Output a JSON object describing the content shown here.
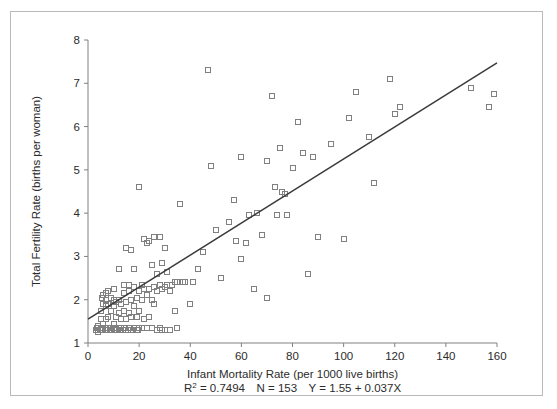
{
  "figure": {
    "frame_color": "#b9b9b9",
    "background": "#ffffff",
    "axis_color": "#808080",
    "marker_color": "#808080",
    "line_color": "#3a3a3a"
  },
  "chart_data": {
    "type": "scatter",
    "title": "",
    "xlabel": "Infant Mortality Rate (per 1000 live births)",
    "ylabel": "Total Fertility Rate (births per woman)",
    "xlim": [
      0,
      160
    ],
    "ylim": [
      1,
      8
    ],
    "xticks": [
      0,
      20,
      40,
      60,
      80,
      100,
      120,
      140,
      160
    ],
    "yticks": [
      1,
      2,
      3,
      4,
      5,
      6,
      7,
      8
    ],
    "grid": false,
    "legend": "none",
    "marker": "open-square",
    "annotations": {
      "r_squared_label": "R",
      "r_squared_exponent": "2",
      "r_squared_value": "= 0.7494",
      "n_label": "N = 153",
      "equation": "Y = 1.55 + 0.037X",
      "full_text": "R2 = 0.7494   N = 153   Y = 1.55 + 0.037X"
    },
    "fit_line": {
      "type": "linear",
      "intercept": 1.55,
      "slope": 0.037,
      "r_squared": 0.7494,
      "n": 153,
      "x_start": 0,
      "x_end": 160,
      "y_start": 1.55,
      "y_end": 7.47
    },
    "points": [
      [
        3,
        1.3
      ],
      [
        3.5,
        1.35
      ],
      [
        4,
        1.25
      ],
      [
        4,
        1.4
      ],
      [
        4.5,
        1.3
      ],
      [
        5,
        1.35
      ],
      [
        5,
        1.55
      ],
      [
        5,
        1.75
      ],
      [
        5.5,
        1.3
      ],
      [
        5.5,
        2.05
      ],
      [
        6,
        1.3
      ],
      [
        6,
        1.45
      ],
      [
        6,
        1.9
      ],
      [
        6,
        2.1
      ],
      [
        6.5,
        1.35
      ],
      [
        7,
        1.3
      ],
      [
        7,
        1.55
      ],
      [
        7,
        1.85
      ],
      [
        7,
        2.0
      ],
      [
        7,
        2.15
      ],
      [
        7.5,
        1.3
      ],
      [
        8,
        1.35
      ],
      [
        8,
        1.6
      ],
      [
        8,
        1.9
      ],
      [
        8,
        2.2
      ],
      [
        8.5,
        1.3
      ],
      [
        9,
        1.35
      ],
      [
        9,
        1.75
      ],
      [
        9,
        2.05
      ],
      [
        9.5,
        1.3
      ],
      [
        10,
        1.3
      ],
      [
        10,
        1.45
      ],
      [
        10,
        1.85
      ],
      [
        10,
        2.0
      ],
      [
        10,
        2.25
      ],
      [
        10.5,
        1.35
      ],
      [
        11,
        1.3
      ],
      [
        11,
        1.6
      ],
      [
        11,
        1.95
      ],
      [
        11.5,
        1.3
      ],
      [
        12,
        1.35
      ],
      [
        12,
        1.7
      ],
      [
        12,
        2.0
      ],
      [
        12,
        2.7
      ],
      [
        12.5,
        1.3
      ],
      [
        13,
        1.35
      ],
      [
        13,
        1.55
      ],
      [
        13,
        1.9
      ],
      [
        13.5,
        1.3
      ],
      [
        14,
        1.35
      ],
      [
        14,
        1.75
      ],
      [
        14,
        2.15
      ],
      [
        14,
        2.35
      ],
      [
        15,
        1.3
      ],
      [
        15,
        1.55
      ],
      [
        15,
        1.95
      ],
      [
        15,
        3.2
      ],
      [
        15.5,
        1.3
      ],
      [
        16,
        1.35
      ],
      [
        16,
        1.7
      ],
      [
        16,
        2.2
      ],
      [
        16,
        2.35
      ],
      [
        16.5,
        1.35
      ],
      [
        17,
        1.3
      ],
      [
        17,
        1.6
      ],
      [
        17,
        2.0
      ],
      [
        17,
        3.15
      ],
      [
        18,
        1.35
      ],
      [
        18,
        1.85
      ],
      [
        18,
        2.3
      ],
      [
        18,
        2.7
      ],
      [
        19,
        1.3
      ],
      [
        19,
        1.6
      ],
      [
        19,
        2.05
      ],
      [
        19.5,
        1.3
      ],
      [
        20,
        1.35
      ],
      [
        20,
        1.75
      ],
      [
        20,
        2.2
      ],
      [
        20,
        4.6
      ],
      [
        21,
        1.35
      ],
      [
        21,
        2.0
      ],
      [
        21,
        2.35
      ],
      [
        22,
        1.55
      ],
      [
        22,
        2.25
      ],
      [
        22,
        3.4
      ],
      [
        23,
        1.35
      ],
      [
        23,
        2.1
      ],
      [
        23,
        3.3
      ],
      [
        24,
        1.6
      ],
      [
        24,
        2.25
      ],
      [
        24,
        3.35
      ],
      [
        25,
        1.35
      ],
      [
        25,
        2.0
      ],
      [
        25,
        2.8
      ],
      [
        26,
        1.9
      ],
      [
        26,
        2.3
      ],
      [
        26,
        3.45
      ],
      [
        27,
        1.3
      ],
      [
        27,
        2.2
      ],
      [
        27,
        2.6
      ],
      [
        28,
        1.35
      ],
      [
        28,
        2.35
      ],
      [
        28,
        3.45
      ],
      [
        29,
        1.3
      ],
      [
        29,
        2.25
      ],
      [
        29,
        2.85
      ],
      [
        30,
        1.3
      ],
      [
        30,
        2.3
      ],
      [
        30,
        3.2
      ],
      [
        31,
        2.35
      ],
      [
        31,
        2.65
      ],
      [
        32,
        1.3
      ],
      [
        32,
        2.2
      ],
      [
        33,
        2.35
      ],
      [
        34,
        1.75
      ],
      [
        34,
        2.4
      ],
      [
        35,
        1.35
      ],
      [
        35,
        2.4
      ],
      [
        36,
        4.2
      ],
      [
        37,
        2.4
      ],
      [
        38,
        2.4
      ],
      [
        40,
        1.9
      ],
      [
        41,
        2.4
      ],
      [
        43,
        2.7
      ],
      [
        45,
        3.1
      ],
      [
        47,
        7.3
      ],
      [
        48,
        5.1
      ],
      [
        50,
        3.6
      ],
      [
        52,
        2.5
      ],
      [
        55,
        3.8
      ],
      [
        57,
        4.3
      ],
      [
        58,
        3.35
      ],
      [
        60,
        2.95
      ],
      [
        60,
        5.3
      ],
      [
        62,
        3.3
      ],
      [
        63,
        3.95
      ],
      [
        65,
        2.25
      ],
      [
        66,
        4.0
      ],
      [
        68,
        3.5
      ],
      [
        70,
        2.05
      ],
      [
        70,
        5.2
      ],
      [
        72,
        6.7
      ],
      [
        73,
        4.6
      ],
      [
        74,
        3.95
      ],
      [
        75,
        5.5
      ],
      [
        76,
        4.5
      ],
      [
        77,
        4.45
      ],
      [
        78,
        3.95
      ],
      [
        80,
        5.05
      ],
      [
        82,
        6.1
      ],
      [
        84,
        5.4
      ],
      [
        86,
        2.6
      ],
      [
        88,
        5.3
      ],
      [
        90,
        3.45
      ],
      [
        95,
        5.6
      ],
      [
        100,
        3.4
      ],
      [
        102,
        6.2
      ],
      [
        105,
        6.8
      ],
      [
        110,
        5.75
      ],
      [
        112,
        4.7
      ],
      [
        118,
        7.1
      ],
      [
        120,
        6.3
      ],
      [
        122,
        6.45
      ],
      [
        150,
        6.9
      ],
      [
        157,
        6.45
      ],
      [
        159,
        6.75
      ]
    ]
  }
}
